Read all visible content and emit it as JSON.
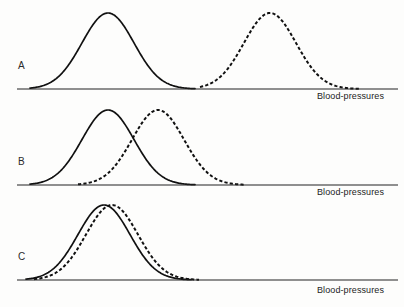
{
  "figure": {
    "title": "",
    "background_color": "#fdfdfc",
    "ink_color": "#111111",
    "axis_color": "#222222",
    "width": 404,
    "height": 307
  },
  "panels": [
    {
      "id": "A",
      "letter": "A",
      "axis_label": "Blood-pressures",
      "description": "Two non-overlapping distributions, widely separated",
      "letter_x": 18,
      "letter_y": 66,
      "baseline_y": 89,
      "axis_x_start": 17,
      "axis_x_end": 398,
      "label_x": 317,
      "label_y": 92
    },
    {
      "id": "B",
      "letter": "B",
      "axis_label": "Blood-pressures",
      "description": "Two partially overlapping distributions",
      "letter_x": 18,
      "letter_y": 162,
      "baseline_y": 185,
      "axis_x_start": 17,
      "axis_x_end": 398,
      "label_x": 317,
      "label_y": 188
    },
    {
      "id": "C",
      "letter": "C",
      "axis_label": "Blood-pressures",
      "description": "Two almost completely overlapping distributions",
      "letter_x": 18,
      "letter_y": 258,
      "baseline_y": 280,
      "axis_x_start": 17,
      "axis_x_end": 398,
      "label_x": 317,
      "label_y": 285
    }
  ],
  "chart_data": {
    "type": "line",
    "title": "",
    "xlabel": "Blood-pressures",
    "ylabel": "",
    "grid": false,
    "legend": "none",
    "axis_ranges": {
      "x": [
        17,
        398
      ],
      "y_panel_A": [
        89,
        13
      ],
      "y_panel_B": [
        185,
        110
      ],
      "y_panel_C": [
        280,
        205
      ]
    },
    "panels": [
      {
        "panel": "A",
        "separation": "complete",
        "series": [
          {
            "name": "solid-curve-A",
            "style": "solid",
            "mean": 108,
            "sigma": 26,
            "peak_y": 13,
            "baseline_y": 89,
            "x_start": 30,
            "x_end": 195
          },
          {
            "name": "dashed-curve-A",
            "style": "dashed",
            "mean": 270,
            "sigma": 26,
            "peak_y": 13,
            "baseline_y": 89,
            "x_start": 200,
            "x_end": 360
          }
        ]
      },
      {
        "panel": "B",
        "separation": "partial",
        "series": [
          {
            "name": "solid-curve-B",
            "style": "solid",
            "mean": 108,
            "sigma": 26,
            "peak_y": 110,
            "baseline_y": 185,
            "x_start": 30,
            "x_end": 195
          },
          {
            "name": "dashed-curve-B",
            "style": "dashed",
            "mean": 158,
            "sigma": 26,
            "peak_y": 110,
            "baseline_y": 185,
            "x_start": 78,
            "x_end": 245
          }
        ]
      },
      {
        "panel": "C",
        "separation": "minimal",
        "series": [
          {
            "name": "solid-curve-C",
            "style": "solid",
            "mean": 104,
            "sigma": 26,
            "peak_y": 205,
            "baseline_y": 280,
            "x_start": 26,
            "x_end": 191
          },
          {
            "name": "dashed-curve-C",
            "style": "dashed",
            "mean": 112,
            "sigma": 26,
            "peak_y": 205,
            "baseline_y": 280,
            "x_start": 34,
            "x_end": 199
          }
        ]
      }
    ]
  }
}
